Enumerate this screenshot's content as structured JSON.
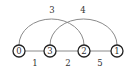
{
  "diagram": {
    "type": "graph",
    "nodes": [
      {
        "id": "0",
        "label": "0",
        "x": 19,
        "y": 51
      },
      {
        "id": "3",
        "label": "3",
        "x": 50,
        "y": 51
      },
      {
        "id": "2",
        "label": "2",
        "x": 84,
        "y": 51
      },
      {
        "id": "1",
        "label": "1",
        "x": 117,
        "y": 51
      }
    ],
    "edges": [
      {
        "from": "0",
        "to": "3",
        "weight": "1",
        "style": "straight",
        "label_pos": [
          35,
          64
        ]
      },
      {
        "from": "3",
        "to": "2",
        "weight": "2",
        "style": "straight",
        "label_pos": [
          67,
          64
        ]
      },
      {
        "from": "2",
        "to": "1",
        "weight": "5",
        "style": "straight",
        "label_pos": [
          100,
          64
        ]
      },
      {
        "from": "0",
        "to": "2",
        "weight": "3",
        "style": "arc",
        "label_pos": [
          51,
          11
        ]
      },
      {
        "from": "3",
        "to": "1",
        "weight": "4",
        "style": "arc",
        "label_pos": [
          83,
          11
        ]
      }
    ]
  },
  "labels": {
    "node_0": "0",
    "node_3": "3",
    "node_2": "2",
    "node_1": "1",
    "edge_0_3": "1",
    "edge_3_2": "2",
    "edge_2_1": "5",
    "edge_0_2": "3",
    "edge_3_1": "4"
  }
}
